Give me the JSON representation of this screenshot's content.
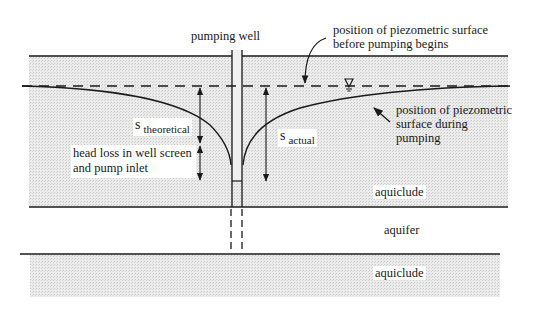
{
  "labels": {
    "pumping_well": "pumping well",
    "piezometric_before": [
      "position of piezometric surface",
      "before pumping begins"
    ],
    "piezometric_during": [
      "position of piezometric",
      "surface during",
      "pumping"
    ],
    "s_theoretical_main": "s",
    "s_theoretical_sub": "theoretical",
    "s_actual_main": "s",
    "s_actual_sub": "actual",
    "head_loss": [
      "head loss in well screen",
      "and pump inlet"
    ],
    "aquiclude_upper": "aquiclude",
    "aquifer": "aquifer",
    "aquiclude_lower": "aquiclude",
    "water_table_symbol": "∇"
  },
  "colors": {
    "line": "#1a1a1a",
    "shading": "#e4e4e4",
    "background": "#ffffff"
  }
}
